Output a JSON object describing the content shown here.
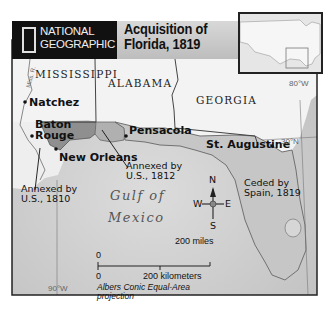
{
  "header": {
    "publisher_line1": "NATIONAL",
    "publisher_line2": "GEOGRAPHIC",
    "title_line1": "Acquisition of",
    "title_line2": "Florida, 1819"
  },
  "map": {
    "states": [
      "MISSISSIPPI",
      "ALABAMA",
      "GEORGIA"
    ],
    "cities": [
      "Natchez",
      "Baton",
      "Rouge",
      "New Orleans",
      "Pensacola",
      "St. Augustine"
    ],
    "annotations": {
      "west_line1": "Annexed by",
      "west_line2": "U.S., 1810",
      "middle_line1": "Annexed by",
      "middle_line2": "U.S., 1812",
      "east_line1": "Ceded by",
      "east_line2": "Spain, 1819"
    },
    "water_line1": "Gulf of",
    "water_line2": "Mexico",
    "river_label": "Miss. R.",
    "gridlines": {
      "lon_east": "80°W",
      "lat": "30°N",
      "lon_west": "90°W"
    },
    "compass": {
      "n": "N",
      "s": "S",
      "e": "E",
      "w": "W"
    },
    "scale": {
      "miles_zero": "0",
      "miles_label": "200 miles",
      "km_zero": "0",
      "km_label": "200 kilometers"
    },
    "projection_line1": "Albers Conic Equal-Area",
    "projection_line2": "projection",
    "colors": {
      "land": "#f2f2f2",
      "water": "#cfcfcf",
      "annexed_1810": "#8c8c8c",
      "annexed_1812": "#b3b3b3",
      "ceded_1819": "#c4c4c4",
      "header_black": "#111111",
      "header_grey": "#c8c8c8"
    }
  }
}
